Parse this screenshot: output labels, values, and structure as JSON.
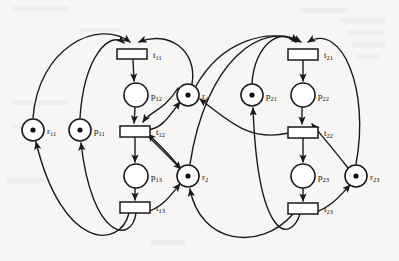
{
  "diagram": {
    "type": "petri-net",
    "canvas": {
      "width": 399,
      "height": 261
    },
    "background_color": "#f7f6f4",
    "stroke_color": "#1a1a1a",
    "fill_color": "#ffffff"
  },
  "places": [
    {
      "id": "r11",
      "label": "r",
      "sub": "11",
      "cx": 33,
      "cy": 130,
      "r": 11,
      "tokens": 1,
      "label_dx": 14,
      "label_dy": 4
    },
    {
      "id": "p11",
      "label": "p",
      "sub": "11",
      "cx": 80,
      "cy": 130,
      "r": 11,
      "tokens": 1,
      "label_dx": 14,
      "label_dy": 4
    },
    {
      "id": "p12",
      "label": "p",
      "sub": "12",
      "cx": 136,
      "cy": 95,
      "r": 12,
      "tokens": 0,
      "label_dx": 15,
      "label_dy": 4
    },
    {
      "id": "p13",
      "label": "p",
      "sub": "13",
      "cx": 136,
      "cy": 176,
      "r": 12,
      "tokens": 0,
      "label_dx": 15,
      "label_dy": 4
    },
    {
      "id": "r4",
      "label": "r",
      "sub": "4",
      "cx": 188,
      "cy": 95,
      "r": 11,
      "tokens": 1,
      "label_dx": 14,
      "label_dy": 4
    },
    {
      "id": "r2",
      "label": "r",
      "sub": "2",
      "cx": 188,
      "cy": 176,
      "r": 11,
      "tokens": 1,
      "label_dx": 14,
      "label_dy": 4
    },
    {
      "id": "p21",
      "label": "p",
      "sub": "21",
      "cx": 252,
      "cy": 95,
      "r": 11,
      "tokens": 1,
      "label_dx": 14,
      "label_dy": 4
    },
    {
      "id": "p22",
      "label": "p",
      "sub": "22",
      "cx": 303,
      "cy": 95,
      "r": 12,
      "tokens": 0,
      "label_dx": 15,
      "label_dy": 4
    },
    {
      "id": "p23",
      "label": "p",
      "sub": "23",
      "cx": 303,
      "cy": 176,
      "r": 12,
      "tokens": 0,
      "label_dx": 15,
      "label_dy": 4
    },
    {
      "id": "r23",
      "label": "r",
      "sub": "23",
      "cx": 356,
      "cy": 176,
      "r": 11,
      "tokens": 1,
      "label_dx": 14,
      "label_dy": 4
    }
  ],
  "transitions": [
    {
      "id": "t11",
      "label": "t",
      "sub": "11",
      "x": 117,
      "y": 49,
      "w": 30,
      "h": 10,
      "label_dx": 36,
      "label_dy": 9
    },
    {
      "id": "t12",
      "label": "t",
      "sub": "12",
      "x": 120,
      "y": 126,
      "w": 30,
      "h": 11,
      "label_dx": 36,
      "label_dy": 9
    },
    {
      "id": "t13",
      "label": "t",
      "sub": "13",
      "x": 120,
      "y": 202,
      "w": 30,
      "h": 11,
      "label_dx": 36,
      "label_dy": 9
    },
    {
      "id": "t21",
      "label": "t",
      "sub": "21",
      "x": 288,
      "y": 49,
      "w": 30,
      "h": 11,
      "label_dx": 36,
      "label_dy": 9
    },
    {
      "id": "t22",
      "label": "t",
      "sub": "22",
      "x": 288,
      "y": 127,
      "w": 30,
      "h": 11,
      "label_dx": 36,
      "label_dy": 9
    },
    {
      "id": "t23",
      "label": "t",
      "sub": "23",
      "x": 288,
      "y": 203,
      "w": 30,
      "h": 11,
      "label_dx": 36,
      "label_dy": 9
    }
  ],
  "arcs": [
    {
      "id": "a-p11-t11",
      "from": "p11",
      "to": "t11",
      "d": "M 80 118 C 84 56 110 30 124 43"
    },
    {
      "id": "a-r11-t11",
      "from": "r11",
      "to": "t11",
      "d": "M 33 118 C 38 48 98 18 130 42"
    },
    {
      "id": "a-r4-t11",
      "from": "r4",
      "to": "t11",
      "d": "M 192 84 C 198 50 168 30 139 42"
    },
    {
      "id": "a-t11-p12",
      "from": "t11",
      "to": "p12",
      "d": "M 133 60 L 134 81"
    },
    {
      "id": "a-p12-t12",
      "from": "p12",
      "to": "t12",
      "d": "M 135 108 L 134 123"
    },
    {
      "id": "a-r4-t12",
      "from": "r4",
      "to": "t12",
      "d": "M 178 88 C 163 112 151 110 143 122"
    },
    {
      "id": "a-t12-p13",
      "from": "t12",
      "to": "p13",
      "d": "M 135 137 L 135 162"
    },
    {
      "id": "a-t12-r4",
      "from": "t12",
      "to": "r4",
      "d": "M 148 130 C 162 128 168 118 180 102"
    },
    {
      "id": "a-p13-t13",
      "from": "p13",
      "to": "t13",
      "d": "M 135 188 L 135 200"
    },
    {
      "id": "a-t13-r11",
      "from": "t13",
      "to": "r11",
      "d": "M 129 213 C 120 250 62 250 36 142"
    },
    {
      "id": "a-t13-p11",
      "from": "t13",
      "to": "p11",
      "d": "M 136 213 C 132 244 92 240 81 143"
    },
    {
      "id": "a-t13-r2",
      "from": "t13",
      "to": "r2",
      "d": "M 146 212 C 162 208 170 196 180 184"
    },
    {
      "id": "a-r2-t12b",
      "from": "r2",
      "to": "t12",
      "d": "M 180 168 C 166 150 156 142 148 134"
    },
    {
      "id": "a-t12-r2b",
      "from": "t12",
      "to": "r2",
      "d": "M 148 136 C 164 152 172 160 181 169"
    },
    {
      "id": "a-p21-t21",
      "from": "p21",
      "to": "t21",
      "d": "M 252 84 C 254 44 282 26 296 42"
    },
    {
      "id": "a-r23-t21",
      "from": "r23",
      "to": "t21",
      "d": "M 356 164 C 370 90 342 22 308 42"
    },
    {
      "id": "a-r2-t21",
      "from": "r2",
      "to": "t21",
      "d": "M 190 164 C 206 60 262 20 301 42"
    },
    {
      "id": "a-r4-t21",
      "from": "r4",
      "to": "t21",
      "d": "M 196 86 C 222 40 268 28 299 41"
    },
    {
      "id": "a-t21-p22",
      "from": "t21",
      "to": "p22",
      "d": "M 303 60 L 303 81"
    },
    {
      "id": "a-p22-t22",
      "from": "p22",
      "to": "t22",
      "d": "M 302 108 L 302 124"
    },
    {
      "id": "a-r23-t22",
      "from": "r23",
      "to": "t22",
      "d": "M 348 168 C 334 150 322 136 312 124"
    },
    {
      "id": "a-t22-p23",
      "from": "t22",
      "to": "p23",
      "d": "M 303 138 L 303 162"
    },
    {
      "id": "a-t22-r4",
      "from": "t22",
      "to": "r4",
      "d": "M 289 133 C 250 142 230 122 200 99"
    },
    {
      "id": "a-p23-t23",
      "from": "p23",
      "to": "t23",
      "d": "M 303 188 L 303 201"
    },
    {
      "id": "a-t23-r23",
      "from": "t23",
      "to": "r23",
      "d": "M 313 213 C 330 208 340 196 350 185"
    },
    {
      "id": "a-t23-p21",
      "from": "t23",
      "to": "p21",
      "d": "M 300 214 C 290 244 258 240 253 108"
    },
    {
      "id": "a-t23-r2",
      "from": "t23",
      "to": "r2",
      "d": "M 293 214 C 260 252 200 244 190 189"
    }
  ],
  "smudges": [
    {
      "x": 12,
      "y": 6,
      "w": 58,
      "h": 5
    },
    {
      "x": 300,
      "y": 8,
      "w": 48,
      "h": 5
    },
    {
      "x": 340,
      "y": 18,
      "w": 46,
      "h": 5
    },
    {
      "x": 346,
      "y": 30,
      "w": 40,
      "h": 5
    },
    {
      "x": 352,
      "y": 42,
      "w": 34,
      "h": 5
    },
    {
      "x": 356,
      "y": 54,
      "w": 24,
      "h": 5
    },
    {
      "x": 10,
      "y": 100,
      "w": 60,
      "h": 5
    },
    {
      "x": 10,
      "y": 124,
      "w": 14,
      "h": 5
    },
    {
      "x": 6,
      "y": 178,
      "w": 40,
      "h": 5
    },
    {
      "x": 150,
      "y": 240,
      "w": 36,
      "h": 5
    },
    {
      "x": 80,
      "y": 28,
      "w": 40,
      "h": 4
    }
  ]
}
